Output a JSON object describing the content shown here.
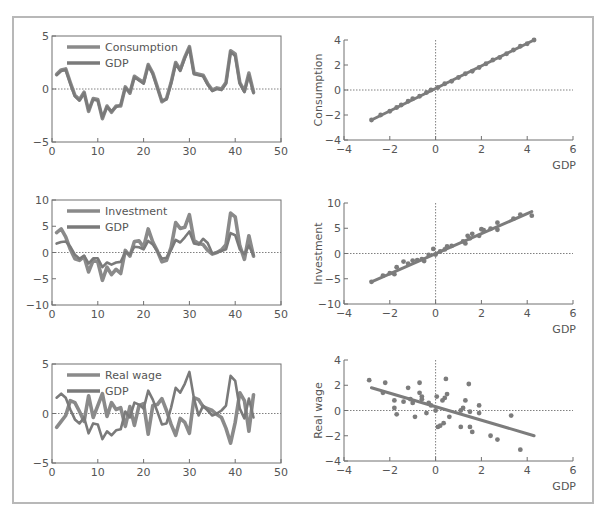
{
  "colors": {
    "series_primary": "#8a8a8a",
    "series_gdp": "#7a7a7a",
    "axis": "#707070",
    "frame": "#b8b8b8",
    "text": "#555555"
  },
  "chart_data": [
    {
      "id": "ts-consumption",
      "type": "line",
      "title": "",
      "xlabel": "",
      "ylabel": "",
      "xlim": [
        0,
        50
      ],
      "ylim": [
        -5,
        5
      ],
      "xticks": [
        0,
        10,
        20,
        30,
        40,
        50
      ],
      "yticks": [
        -5,
        0,
        5
      ],
      "zero_line": true,
      "legend": [
        "Consumption",
        "GDP"
      ],
      "legend_position": "upper left",
      "x": [
        1,
        2,
        3,
        4,
        5,
        6,
        7,
        8,
        9,
        10,
        11,
        12,
        13,
        14,
        15,
        16,
        17,
        18,
        19,
        20,
        21,
        22,
        23,
        24,
        25,
        26,
        27,
        28,
        29,
        30,
        31,
        32,
        33,
        34,
        35,
        36,
        37,
        38,
        39,
        40,
        41,
        42,
        43,
        44
      ],
      "series": [
        {
          "name": "Consumption",
          "values": [
            1.4,
            1.8,
            1.9,
            0.6,
            -0.6,
            -1.0,
            -0.3,
            -2.1,
            -0.9,
            -1.0,
            -2.8,
            -1.6,
            -2.2,
            -1.6,
            -1.6,
            0.2,
            -0.4,
            1.2,
            0.9,
            0.6,
            2.3,
            1.5,
            0.2,
            -1.2,
            -0.9,
            0.6,
            2.5,
            1.8,
            3.0,
            4.0,
            1.5,
            1.4,
            1.3,
            0.5,
            -0.1,
            0.1,
            0.0,
            0.6,
            3.6,
            3.3,
            0.6,
            -0.2,
            1.5,
            -0.3
          ]
        },
        {
          "name": "GDP",
          "values": [
            1.3,
            1.7,
            1.8,
            0.5,
            -0.7,
            -1.1,
            -0.4,
            -2.0,
            -1.0,
            -1.1,
            -2.7,
            -1.7,
            -2.1,
            -1.7,
            -1.5,
            0.1,
            -0.3,
            1.1,
            0.8,
            0.5,
            2.2,
            1.4,
            0.1,
            -1.1,
            -1.0,
            0.5,
            2.4,
            1.7,
            2.9,
            3.9,
            1.4,
            1.3,
            1.2,
            0.4,
            -0.2,
            0.0,
            -0.1,
            0.5,
            3.5,
            3.1,
            0.5,
            -0.3,
            1.3,
            -0.4
          ]
        }
      ]
    },
    {
      "id": "sc-consumption",
      "type": "scatter",
      "title": "",
      "xlabel": "GDP",
      "ylabel": "Consumption",
      "xlim": [
        -4,
        6
      ],
      "ylim": [
        -4,
        4
      ],
      "xticks": [
        -4,
        -2,
        0,
        2,
        4,
        6
      ],
      "yticks": [
        -4,
        -2,
        0,
        2,
        4
      ],
      "zero_lines": true,
      "fit_line": {
        "x": [
          -2.8,
          4.3
        ],
        "y": [
          -2.4,
          4.0
        ]
      },
      "points": {
        "x": [
          -2.8,
          -2.4,
          -2.0,
          -1.7,
          -1.5,
          -1.2,
          -1.0,
          -0.7,
          -0.4,
          -0.2,
          0.1,
          0.4,
          0.7,
          1.0,
          1.3,
          1.6,
          1.9,
          2.2,
          2.5,
          2.8,
          3.1,
          3.4,
          3.7,
          4.0,
          4.3
        ],
        "y": [
          -2.4,
          -2.0,
          -1.7,
          -1.4,
          -1.2,
          -0.9,
          -0.7,
          -0.5,
          -0.2,
          0.0,
          0.2,
          0.5,
          0.7,
          1.0,
          1.3,
          1.5,
          1.8,
          2.1,
          2.4,
          2.6,
          2.9,
          3.2,
          3.5,
          3.7,
          4.0
        ]
      }
    },
    {
      "id": "ts-investment",
      "type": "line",
      "title": "",
      "xlabel": "",
      "ylabel": "",
      "xlim": [
        0,
        50
      ],
      "ylim": [
        -10,
        10
      ],
      "xticks": [
        0,
        10,
        20,
        30,
        40,
        50
      ],
      "yticks": [
        -10,
        -5,
        0,
        5,
        10
      ],
      "zero_line": true,
      "legend": [
        "Investment",
        "GDP"
      ],
      "legend_position": "upper left",
      "x": [
        1,
        2,
        3,
        4,
        5,
        6,
        7,
        8,
        9,
        10,
        11,
        12,
        13,
        14,
        15,
        16,
        17,
        18,
        19,
        20,
        21,
        22,
        23,
        24,
        25,
        26,
        27,
        28,
        29,
        30,
        31,
        32,
        33,
        34,
        35,
        36,
        37,
        38,
        39,
        40,
        41,
        42,
        43,
        44
      ],
      "series": [
        {
          "name": "Investment",
          "values": [
            3.8,
            4.5,
            3.0,
            0.6,
            -1.2,
            -1.5,
            -0.8,
            -3.7,
            -1.5,
            -1.8,
            -5.3,
            -2.8,
            -4.2,
            -3.2,
            -4.0,
            0.4,
            -0.7,
            2.1,
            2.2,
            1.0,
            4.5,
            2.0,
            0.3,
            -1.8,
            -1.5,
            1.0,
            5.7,
            4.6,
            4.8,
            7.2,
            2.3,
            1.7,
            1.5,
            0.4,
            -0.3,
            0.0,
            0.5,
            1.5,
            7.5,
            6.8,
            1.3,
            -1.3,
            3.2,
            -0.7
          ]
        },
        {
          "name": "GDP",
          "values": [
            1.7,
            2.0,
            2.1,
            1.1,
            -0.4,
            -1.2,
            -0.6,
            -2.1,
            -1.1,
            -1.1,
            -2.8,
            -1.9,
            -2.3,
            -1.9,
            -1.8,
            0.1,
            -0.4,
            1.1,
            1.0,
            0.6,
            2.2,
            1.5,
            0.2,
            -1.2,
            -1.0,
            0.5,
            2.4,
            1.9,
            2.9,
            4.0,
            1.7,
            1.5,
            2.6,
            1.8,
            -0.2,
            0.0,
            0.3,
            0.6,
            3.7,
            3.3,
            0.6,
            -0.3,
            1.3,
            -0.5
          ]
        }
      ]
    },
    {
      "id": "sc-investment",
      "type": "scatter",
      "title": "",
      "xlabel": "GDP",
      "ylabel": "Investment",
      "xlim": [
        -4,
        6
      ],
      "ylim": [
        -10,
        10
      ],
      "xticks": [
        -4,
        -2,
        0,
        2,
        4,
        6
      ],
      "yticks": [
        -10,
        -5,
        0,
        5,
        10
      ],
      "zero_lines": true,
      "fit_line": {
        "x": [
          -2.8,
          4.2
        ],
        "y": [
          -5.6,
          8.3
        ]
      },
      "points": {
        "x": [
          -2.8,
          -2.3,
          -2.0,
          -1.8,
          -1.7,
          -1.4,
          -1.2,
          -1.0,
          -0.8,
          -0.6,
          -0.5,
          -0.3,
          -0.1,
          0.0,
          0.2,
          0.4,
          0.5,
          0.7,
          1.2,
          1.3,
          1.4,
          1.5,
          1.6,
          1.9,
          2.0,
          2.1,
          2.4,
          2.7,
          2.7,
          3.4,
          3.7,
          4.2
        ],
        "y": [
          -5.6,
          -4.4,
          -3.9,
          -4.1,
          -2.7,
          -1.6,
          -2.0,
          -1.4,
          -1.3,
          -1.1,
          -1.5,
          -0.3,
          0.9,
          -0.2,
          0.4,
          0.8,
          1.4,
          1.5,
          2.4,
          2.0,
          3.5,
          3.0,
          3.9,
          3.5,
          4.8,
          4.6,
          4.9,
          4.7,
          6.1,
          6.9,
          7.7,
          7.5
        ]
      }
    },
    {
      "id": "ts-realwage",
      "type": "line",
      "title": "",
      "xlabel": "",
      "ylabel": "",
      "xlim": [
        0,
        50
      ],
      "ylim": [
        -5,
        5
      ],
      "xticks": [
        0,
        10,
        20,
        30,
        40,
        50
      ],
      "yticks": [
        -5,
        0,
        5
      ],
      "zero_line": true,
      "legend": [
        "Real wage",
        "GDP"
      ],
      "legend_position": "upper left",
      "x": [
        1,
        2,
        3,
        4,
        5,
        6,
        7,
        8,
        9,
        10,
        11,
        12,
        13,
        14,
        15,
        16,
        17,
        18,
        19,
        20,
        21,
        22,
        23,
        24,
        25,
        26,
        27,
        28,
        29,
        30,
        31,
        32,
        33,
        34,
        35,
        36,
        37,
        38,
        39,
        40,
        41,
        42,
        43,
        44
      ],
      "series": [
        {
          "name": "Real wage",
          "values": [
            -1.4,
            -0.8,
            -0.2,
            1.3,
            1.1,
            0.2,
            -0.8,
            1.8,
            -0.4,
            0.8,
            2.0,
            -0.3,
            1.1,
            0.4,
            0.6,
            -1.3,
            0.7,
            -1.2,
            0.8,
            1.0,
            -2.1,
            0.8,
            0.9,
            1.5,
            0.3,
            -1.1,
            -2.2,
            -0.5,
            -0.9,
            -2.0,
            1.6,
            1.4,
            0.7,
            0.5,
            0.3,
            -0.1,
            -0.4,
            -1.5,
            -3.0,
            -0.9,
            2.1,
            1.3,
            -1.8,
            1.9
          ]
        },
        {
          "name": "GDP",
          "values": [
            1.6,
            2.0,
            1.6,
            0.4,
            -0.6,
            -1.0,
            -0.4,
            -2.0,
            -1.0,
            -1.1,
            -2.6,
            -1.8,
            -2.2,
            -1.7,
            -1.6,
            0.2,
            -0.4,
            1.1,
            0.9,
            0.5,
            2.3,
            1.4,
            0.2,
            -1.1,
            -1.0,
            0.6,
            2.6,
            2.1,
            3.0,
            4.2,
            1.5,
            -0.2,
            0.8,
            0.3,
            -0.2,
            0.0,
            0.3,
            0.8,
            3.8,
            3.3,
            0.5,
            -0.5,
            1.5,
            -0.4
          ]
        }
      ]
    },
    {
      "id": "sc-realwage",
      "type": "scatter",
      "title": "",
      "xlabel": "GDP",
      "ylabel": "Real wage",
      "xlim": [
        -4,
        6
      ],
      "ylim": [
        -4,
        4
      ],
      "xticks": [
        -4,
        -2,
        0,
        2,
        4,
        6
      ],
      "yticks": [
        -4,
        -2,
        0,
        2,
        4
      ],
      "zero_lines": true,
      "fit_line": {
        "x": [
          -2.8,
          4.3
        ],
        "y": [
          1.8,
          -2.0
        ]
      },
      "points": {
        "x": [
          -2.9,
          -2.3,
          -2.2,
          -1.8,
          -1.8,
          -1.7,
          -1.4,
          -1.2,
          -1.1,
          -1.0,
          -0.9,
          -0.7,
          -0.7,
          -0.6,
          -0.6,
          -0.4,
          -0.3,
          -0.2,
          0.0,
          0.05,
          0.1,
          0.2,
          0.3,
          0.35,
          0.4,
          0.45,
          0.5,
          0.6,
          1.1,
          1.1,
          1.2,
          1.3,
          1.45,
          1.5,
          1.5,
          1.6,
          1.9,
          1.9,
          2.4,
          2.7,
          3.3,
          3.7
        ],
        "y": [
          2.4,
          1.4,
          2.2,
          0.8,
          0.2,
          -0.3,
          0.7,
          1.8,
          0.9,
          0.6,
          -0.5,
          1.4,
          2.2,
          0.9,
          1.1,
          -0.2,
          0.6,
          0.4,
          0.0,
          1.1,
          -1.3,
          -1.2,
          0.8,
          -1.0,
          1.0,
          2.5,
          1.3,
          -0.5,
          0.0,
          -1.3,
          0.2,
          0.8,
          2.1,
          -0.1,
          -1.3,
          -1.7,
          0.4,
          -0.2,
          -2.0,
          -2.3,
          -0.4,
          -3.1
        ]
      }
    }
  ]
}
